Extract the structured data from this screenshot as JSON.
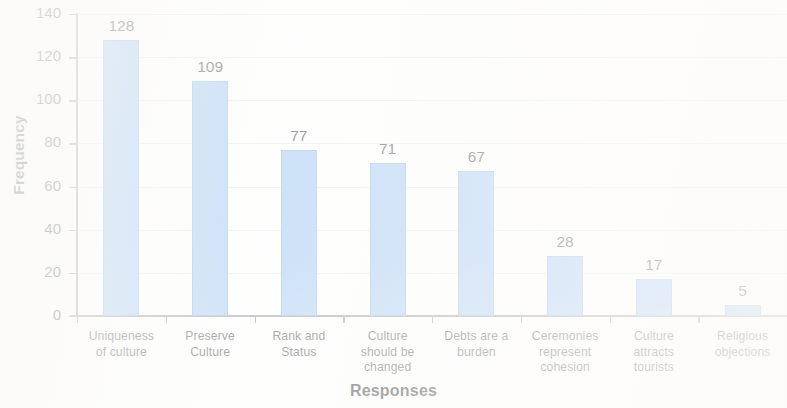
{
  "chart_data": {
    "type": "bar",
    "title": "",
    "xlabel": "Responses",
    "ylabel": "Frequency",
    "categories": [
      "Uniqueness of culture",
      "Preserve Culture",
      "Rank and Status",
      "Culture should be changed",
      "Debts are a burden",
      "Ceremonies represent cohesion",
      "Culture attracts tourists",
      "Religious objections"
    ],
    "category_lines": [
      [
        "Uniqueness",
        "of  culture"
      ],
      [
        "Preserve",
        "Culture"
      ],
      [
        "Rank and",
        "Status"
      ],
      [
        "Culture",
        "should be",
        "changed"
      ],
      [
        "Debts are a",
        "burden"
      ],
      [
        "Ceremonies",
        "represent",
        "cohesion"
      ],
      [
        "Culture",
        "attracts",
        "tourists"
      ],
      [
        "Religious",
        "objections"
      ]
    ],
    "values": [
      128,
      109,
      77,
      71,
      67,
      28,
      17,
      5
    ],
    "value_labels": [
      "128",
      "109",
      "77",
      "71",
      "67",
      "28",
      "17",
      "5"
    ],
    "ylim": [
      0,
      140
    ],
    "ytick_step": 20,
    "ytick_labels": [
      "140",
      "120",
      "100",
      "80",
      "60",
      "40",
      "20",
      "0"
    ],
    "ytick_values": [
      140,
      120,
      100,
      80,
      60,
      40,
      20,
      0
    ],
    "grid": true,
    "grid_axis": "y",
    "legend": null,
    "bar_color": "#8fbcee",
    "bar_border_color": "#79a9e2",
    "gridline_color": "#e4e4e4",
    "axis_color": "#8a8a8a",
    "text_color": "#1f1f1f",
    "background_color": "#fdfdfc"
  }
}
